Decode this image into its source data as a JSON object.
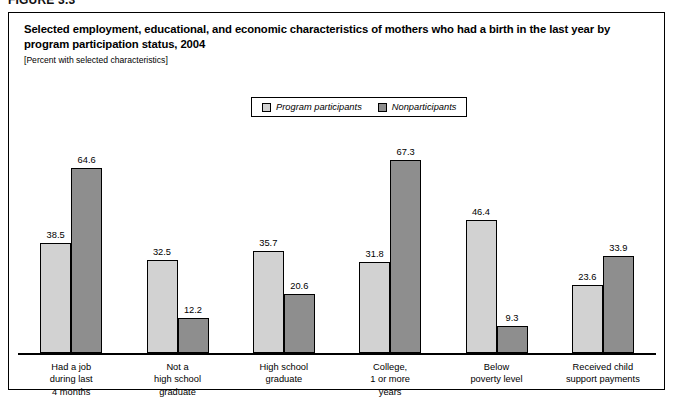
{
  "figure": {
    "number_label": "FIGURE 3.3",
    "title": "Selected employment, educational, and economic characteristics of mothers who had a birth in the last year by program participation status, 2004",
    "subtitle": "[Percent with selected characteristics]"
  },
  "legend": {
    "items": [
      {
        "label": "Program participants",
        "color": "#d2d2d2",
        "swatch": "legend-swatch-light"
      },
      {
        "label": "Nonparticipants",
        "color": "#8e8e8e",
        "swatch": "legend-swatch-dark"
      }
    ]
  },
  "chart_data": {
    "type": "bar",
    "title": "Selected employment, educational, and economic characteristics of mothers who had a birth in the last year by program participation status, 2004",
    "subtitle": "[Percent with selected characteristics]",
    "xlabel": "",
    "ylabel": "",
    "ylim": [
      0,
      72
    ],
    "grid": false,
    "legend_position": "top-center",
    "categories": [
      "Had a job during last 4 months",
      "Not a high school graduate",
      "High school graduate",
      "College, 1 or more years",
      "Below poverty level",
      "Received child support payments"
    ],
    "category_lines": [
      [
        "Had a job",
        "during last",
        "4 months"
      ],
      [
        "Not a",
        "high school",
        "graduate"
      ],
      [
        "High school",
        "graduate"
      ],
      [
        "College,",
        "1 or more",
        "years"
      ],
      [
        "Below",
        "poverty level"
      ],
      [
        "Received child",
        "support payments"
      ]
    ],
    "series": [
      {
        "name": "Program participants",
        "color": "#d2d2d2",
        "values": [
          38.5,
          32.5,
          35.7,
          31.8,
          46.4,
          23.6
        ],
        "labels": [
          "38.5",
          "32.5",
          "35.7",
          "31.8",
          "46.4",
          "23.6"
        ]
      },
      {
        "name": "Nonparticipants",
        "color": "#8e8e8e",
        "values": [
          64.6,
          12.2,
          20.6,
          67.3,
          9.3,
          33.9
        ],
        "labels": [
          "64.6",
          "12.2",
          "20.6",
          "67.3",
          "9.3",
          "33.9"
        ]
      }
    ]
  }
}
